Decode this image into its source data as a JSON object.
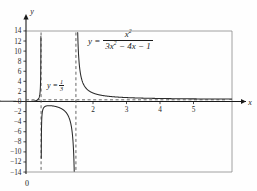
{
  "figure": {
    "equation": {
      "lhs": "y =",
      "numerator": "x²",
      "denominator": "3x² − 4x − 1"
    },
    "asymptote_label": {
      "prefix": "y =",
      "num": "1",
      "den": "3"
    },
    "origin_label": "0",
    "x_axis_label": "x",
    "y_axis_label": "y"
  },
  "chart_data": {
    "type": "line",
    "title": "",
    "function": "y = x^2 / (3x^2 - 4x - 1)",
    "xlabel": "x",
    "ylabel": "y",
    "xlim": [
      -0.78,
      6.14
    ],
    "ylim": [
      -14,
      14
    ],
    "grid": false,
    "legend": "none",
    "x_ticks": [
      2,
      3,
      4,
      5
    ],
    "x_tick_labels": [
      "2",
      "3",
      "4",
      "5"
    ],
    "y_ticks": [
      14,
      12,
      10,
      8,
      6,
      4,
      2,
      0,
      -2,
      -4,
      -6,
      -8,
      -10,
      -12,
      -14
    ],
    "y_tick_labels": [
      "14",
      "12",
      "10",
      "8",
      "6",
      "4",
      "2",
      "0",
      "−2",
      "−4",
      "−6",
      "−8",
      "−10",
      "−12",
      "−14"
    ],
    "vertical_asymptotes": [
      0.45,
      1.49
    ],
    "horizontal_asymptote": 0.3333,
    "horizontal_asymptote_label": "y = 1/3",
    "curve_color": "#2b2b2b",
    "asymptote_color": "#4a4a4a",
    "axis_color": "#1a1a1a",
    "frame_color": "#8a8a8a",
    "branches": [
      {
        "name": "left-branch",
        "x_from": -0.78,
        "x_to": 0.45,
        "note": "rises from y≈0.3 to +∞ at left asymptote"
      },
      {
        "name": "middle-branch",
        "x_from": 0.45,
        "x_to": 1.49,
        "note": "negative arc from −∞ up to about −1.2 then down to −∞"
      },
      {
        "name": "right-branch",
        "x_from": 1.49,
        "x_to": 6.14,
        "note": "falls from +∞ toward horizontal asymptote y = 1/3"
      }
    ]
  }
}
